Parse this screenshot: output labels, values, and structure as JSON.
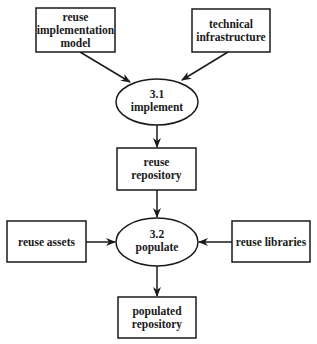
{
  "diagram": {
    "type": "data-flow",
    "nodes": [
      {
        "id": "reuse_impl_model",
        "kind": "store",
        "lines": [
          "reuse",
          "implementation",
          "model"
        ]
      },
      {
        "id": "tech_infra",
        "kind": "store",
        "lines": [
          "technical",
          "infrastructure"
        ]
      },
      {
        "id": "implement",
        "kind": "process",
        "lines": [
          "3.1",
          "implement"
        ]
      },
      {
        "id": "reuse_repository",
        "kind": "store",
        "lines": [
          "reuse",
          "repository"
        ]
      },
      {
        "id": "populate",
        "kind": "process",
        "lines": [
          "3.2",
          "populate"
        ]
      },
      {
        "id": "reuse_assets",
        "kind": "store",
        "lines": [
          "reuse assets"
        ]
      },
      {
        "id": "reuse_libraries",
        "kind": "store",
        "lines": [
          "reuse libraries"
        ]
      },
      {
        "id": "populated_repository",
        "kind": "store",
        "lines": [
          "populated",
          "repository"
        ]
      }
    ],
    "edges": [
      {
        "from": "reuse_impl_model",
        "to": "implement"
      },
      {
        "from": "tech_infra",
        "to": "implement"
      },
      {
        "from": "implement",
        "to": "reuse_repository"
      },
      {
        "from": "reuse_repository",
        "to": "populate"
      },
      {
        "from": "reuse_assets",
        "to": "populate"
      },
      {
        "from": "reuse_libraries",
        "to": "populate"
      },
      {
        "from": "populate",
        "to": "populated_repository"
      }
    ],
    "colors": {
      "stroke": "#1a1a1a",
      "fill": "#ffffff",
      "text": "#1a1a1a"
    }
  }
}
